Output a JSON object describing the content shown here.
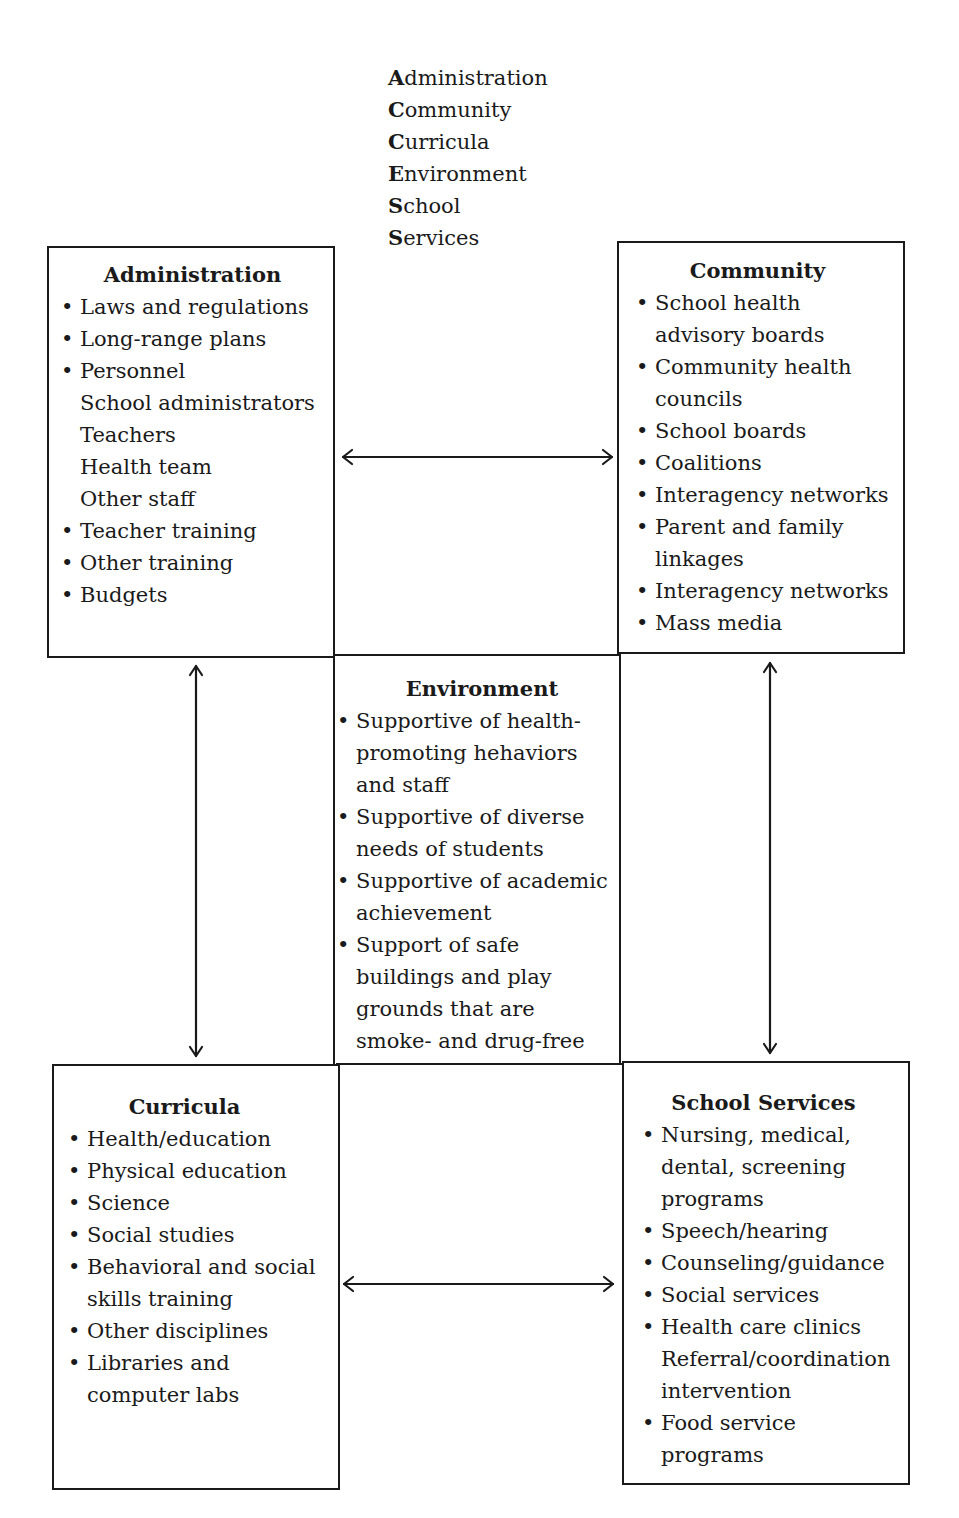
{
  "acronym": {
    "lines": [
      {
        "first": "A",
        "rest": "dministration"
      },
      {
        "first": "C",
        "rest": "ommunity"
      },
      {
        "first": "C",
        "rest": "urricula"
      },
      {
        "first": "E",
        "rest": "nvironment"
      },
      {
        "first": "S",
        "rest": "chool"
      },
      {
        "first": "S",
        "rest": "ervices"
      }
    ]
  },
  "panels": {
    "administration": {
      "title": "Administration",
      "items": [
        {
          "text": "Laws and regulations",
          "bullet": true
        },
        {
          "text": "Long-range plans",
          "bullet": true
        },
        {
          "text": "Personnel",
          "bullet": true
        },
        {
          "text": "School administrators",
          "bullet": false
        },
        {
          "text": "Teachers",
          "bullet": false
        },
        {
          "text": "Health team",
          "bullet": false
        },
        {
          "text": "Other staff",
          "bullet": false
        },
        {
          "text": "Teacher training",
          "bullet": true
        },
        {
          "text": "Other training",
          "bullet": true
        },
        {
          "text": "Budgets",
          "bullet": true
        }
      ]
    },
    "community": {
      "title": "Community",
      "items": [
        {
          "text": "School health",
          "bullet": true
        },
        {
          "text": "advisory boards",
          "bullet": false
        },
        {
          "text": "Community health",
          "bullet": true
        },
        {
          "text": "councils",
          "bullet": false
        },
        {
          "text": "School boards",
          "bullet": true
        },
        {
          "text": "Coalitions",
          "bullet": true
        },
        {
          "text": "Interagency networks",
          "bullet": true
        },
        {
          "text": "Parent and family",
          "bullet": true
        },
        {
          "text": "linkages",
          "bullet": false
        },
        {
          "text": "Interagency networks",
          "bullet": true
        },
        {
          "text": "Mass media",
          "bullet": true
        }
      ]
    },
    "environment": {
      "title": "Environment",
      "items": [
        {
          "text": "Supportive of health-",
          "bullet": true
        },
        {
          "text": "promoting hehaviors",
          "bullet": false
        },
        {
          "text": "and staff",
          "bullet": false
        },
        {
          "text": "Supportive of diverse",
          "bullet": true
        },
        {
          "text": "needs of students",
          "bullet": false
        },
        {
          "text": "Supportive of academic",
          "bullet": true
        },
        {
          "text": "achievement",
          "bullet": false
        },
        {
          "text": "Support of safe",
          "bullet": true
        },
        {
          "text": "buildings and play",
          "bullet": false
        },
        {
          "text": "grounds that are",
          "bullet": false
        },
        {
          "text": "smoke- and drug-free",
          "bullet": false
        }
      ]
    },
    "curricula": {
      "title": "Curricula",
      "items": [
        {
          "text": "Health/education",
          "bullet": true
        },
        {
          "text": "Physical education",
          "bullet": true
        },
        {
          "text": "Science",
          "bullet": true
        },
        {
          "text": "Social studies",
          "bullet": true
        },
        {
          "text": "Behavioral and social",
          "bullet": true
        },
        {
          "text": "skills training",
          "bullet": false
        },
        {
          "text": "Other disciplines",
          "bullet": true
        },
        {
          "text": "Libraries and",
          "bullet": true
        },
        {
          "text": "computer labs",
          "bullet": false
        }
      ]
    },
    "school_services": {
      "title": "School Services",
      "items": [
        {
          "text": "Nursing, medical,",
          "bullet": true
        },
        {
          "text": "dental, screening",
          "bullet": false
        },
        {
          "text": "programs",
          "bullet": false
        },
        {
          "text": "Speech/hearing",
          "bullet": true
        },
        {
          "text": "Counseling/guidance",
          "bullet": true
        },
        {
          "text": "Social services",
          "bullet": true
        },
        {
          "text": "Health care clinics",
          "bullet": true
        },
        {
          "text": "Referral/coordination",
          "bullet": false
        },
        {
          "text": "intervention",
          "bullet": false
        },
        {
          "text": "Food service",
          "bullet": true
        },
        {
          "text": "programs",
          "bullet": false
        }
      ]
    }
  },
  "arrows": [
    {
      "name": "administration-community-arrow",
      "type": "bidirectional-horizontal"
    },
    {
      "name": "curricula-services-arrow",
      "type": "bidirectional-horizontal"
    },
    {
      "name": "administration-curricula-arrow",
      "type": "bidirectional-vertical"
    },
    {
      "name": "community-services-arrow",
      "type": "bidirectional-vertical"
    }
  ],
  "colors": {
    "line": "#1a1a1a",
    "background": "#ffffff"
  }
}
